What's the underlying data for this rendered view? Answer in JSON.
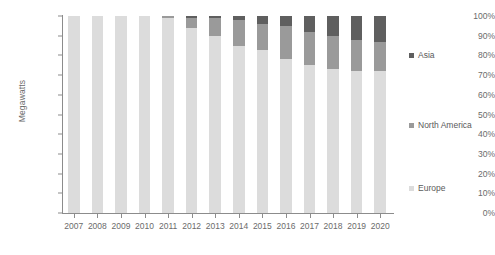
{
  "chart_data": {
    "type": "bar",
    "stacked": true,
    "stack_mode": "percent",
    "title": "",
    "subtitle": "",
    "xlabel": "",
    "ylabel": "Megawatts",
    "ylim": [
      0,
      100
    ],
    "y_unit": "%",
    "grid": false,
    "legend_position": "right",
    "categories": [
      "2007",
      "2008",
      "2009",
      "2010",
      "2011",
      "2012",
      "2013",
      "2014",
      "2015",
      "2016",
      "2017",
      "2018",
      "2019",
      "2020"
    ],
    "y_ticks": [
      "0%",
      "10%",
      "20%",
      "30%",
      "40%",
      "50%",
      "60%",
      "70%",
      "80%",
      "90%",
      "100%"
    ],
    "series": [
      {
        "name": "Europe",
        "color": "#dcdcdc",
        "values": [
          100,
          100,
          100,
          100,
          99,
          94,
          90,
          85,
          83,
          78,
          75,
          73,
          72,
          72
        ]
      },
      {
        "name": "North America",
        "color": "#9a9a9a",
        "values": [
          0,
          0,
          0,
          0,
          1,
          5,
          9,
          13,
          13,
          17,
          17,
          17,
          16,
          15
        ]
      },
      {
        "name": "Asia",
        "color": "#5f5f5f",
        "values": [
          0,
          0,
          0,
          0,
          0,
          1,
          1,
          2,
          4,
          5,
          8,
          10,
          12,
          13
        ]
      }
    ]
  },
  "legend": {
    "items": [
      {
        "label": "Asia",
        "color": "#5f5f5f"
      },
      {
        "label": "North America",
        "color": "#9a9a9a"
      },
      {
        "label": "Europe",
        "color": "#dcdcdc"
      }
    ]
  },
  "axis": {
    "y_title": "Megawatts"
  },
  "colors": {
    "axis_line": "#8c8c8c",
    "tick_text": "#6b6b6b",
    "background": "#ffffff"
  }
}
